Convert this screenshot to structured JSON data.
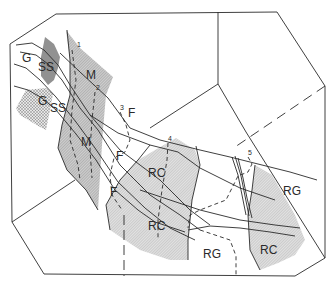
{
  "figure": {
    "type": "geologic map diagram",
    "colors": {
      "line": "#2a2a2a",
      "shade_light": "#d6d6d6",
      "shade_medium": "#bdbdbd",
      "stipple": "#9a9a9a",
      "background": "#ffffff"
    }
  },
  "zones": [
    {
      "id": "G1",
      "label": "G",
      "x": 22,
      "y": 62
    },
    {
      "id": "SS1",
      "label": "SS",
      "x": 38,
      "y": 71
    },
    {
      "id": "G2",
      "label": "G",
      "x": 38,
      "y": 105
    },
    {
      "id": "SS2",
      "label": "SS",
      "x": 50,
      "y": 112
    },
    {
      "id": "M1",
      "label": "M",
      "x": 86,
      "y": 79
    },
    {
      "id": "M2",
      "label": "M",
      "x": 81,
      "y": 146
    },
    {
      "id": "F1",
      "label": "F",
      "x": 128,
      "y": 117
    },
    {
      "id": "F2",
      "label": "F",
      "x": 116,
      "y": 160
    },
    {
      "id": "F3",
      "label": "F",
      "x": 110,
      "y": 196
    },
    {
      "id": "RC1",
      "label": "RC",
      "x": 148,
      "y": 177
    },
    {
      "id": "RC2",
      "label": "RC",
      "x": 148,
      "y": 230
    },
    {
      "id": "RC3",
      "label": "RC",
      "x": 260,
      "y": 254
    },
    {
      "id": "RG1",
      "label": "RG",
      "x": 203,
      "y": 258
    },
    {
      "id": "RG2",
      "label": "RG",
      "x": 283,
      "y": 195
    }
  ],
  "sites": [
    {
      "id": "1",
      "label": "1",
      "x": 77,
      "y": 47
    },
    {
      "id": "2",
      "label": "2",
      "x": 96,
      "y": 90
    },
    {
      "id": "3",
      "label": "3",
      "x": 120,
      "y": 110
    },
    {
      "id": "4",
      "label": "4",
      "x": 168,
      "y": 141
    },
    {
      "id": "5",
      "label": "5",
      "x": 248,
      "y": 155
    }
  ]
}
